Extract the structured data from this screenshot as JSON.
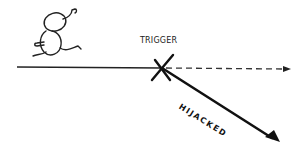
{
  "diagram": {
    "labels": {
      "trigger": "TRIGGER",
      "hijacked": "HIJACKED"
    },
    "elements": {
      "figure": "running-stick-figure",
      "main_path": "solid-line",
      "intended_path": "dashed-arrow",
      "trigger_mark": "x-mark",
      "hijacked_path": "diagonal-arrow"
    },
    "colors": {
      "ink": "#111111",
      "background": "#ffffff"
    }
  }
}
